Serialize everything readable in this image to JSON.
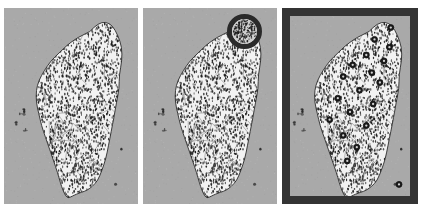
{
  "figure": {
    "background_color": "#ffffff",
    "width": 422,
    "height": 213,
    "panel_count": 3
  },
  "colors": {
    "sea_background": "#a9a9a9",
    "land_fill": "#f2f2f2",
    "stipple_dot": "#1c1c1c",
    "boundary_line": "#5a5a5a",
    "coastline": "#2b2b2b",
    "frame_dark": "#343434",
    "marker_fill": "#1a1a1a",
    "marker_ring": "#111111",
    "highlight_ring": "#2a2a2a",
    "highlight_inner": "#cfcfcf"
  },
  "panels": [
    {
      "id": "panel-a",
      "label": "a",
      "region_name": "Taiwan",
      "has_frame": false,
      "has_highlight_circle": false,
      "marker_count": 0,
      "description": "Base map of Taiwan island with stippled land fill and township boundary lines, surrounded by gray sea, with Penghu archipelago to the west."
    },
    {
      "id": "panel-b",
      "label": "b",
      "region_name": "Taiwan",
      "has_frame": false,
      "has_highlight_circle": true,
      "marker_count": 0,
      "highlight_circle": {
        "center_x_pct": 76,
        "center_y_pct": 12,
        "radius_pct": 13,
        "target_area": "northern Taiwan",
        "ring_color": "#2a2a2a",
        "inner_color": "#cfcfcf"
      },
      "description": "Same base map of Taiwan with a dark circular highlight overlaid on the northern tip of the island."
    },
    {
      "id": "panel-c",
      "label": "c",
      "region_name": "Taiwan",
      "has_frame": true,
      "has_highlight_circle": false,
      "marker_count": 19,
      "frame": {
        "color": "#343434",
        "thickness_px": 8
      },
      "description": "Same base map of Taiwan enclosed in a thick dark rectangular frame, with scattered dark circular point markers distributed across the island and offshore."
    }
  ],
  "map_data": {
    "island_name": "Taiwan",
    "coastline_points": [
      [
        64,
        12
      ],
      [
        70,
        8
      ],
      [
        76,
        7
      ],
      [
        81,
        9
      ],
      [
        85,
        14
      ],
      [
        88,
        20
      ],
      [
        88,
        27
      ],
      [
        86,
        34
      ],
      [
        86,
        41
      ],
      [
        84,
        48
      ],
      [
        82,
        56
      ],
      [
        80,
        63
      ],
      [
        78,
        70
      ],
      [
        76,
        77
      ],
      [
        73,
        83
      ],
      [
        70,
        88
      ],
      [
        66,
        91
      ],
      [
        62,
        93
      ],
      [
        58,
        94
      ],
      [
        54,
        95
      ],
      [
        51,
        96
      ],
      [
        48,
        97
      ],
      [
        46,
        96
      ],
      [
        44,
        93
      ],
      [
        42,
        89
      ],
      [
        40,
        84
      ],
      [
        37,
        78
      ],
      [
        34,
        72
      ],
      [
        31,
        66
      ],
      [
        28,
        60
      ],
      [
        26,
        54
      ],
      [
        24,
        48
      ],
      [
        24,
        42
      ],
      [
        26,
        37
      ],
      [
        30,
        32
      ],
      [
        35,
        27
      ],
      [
        41,
        23
      ],
      [
        47,
        19
      ],
      [
        53,
        16
      ],
      [
        58,
        14
      ]
    ],
    "offshore_islands": [
      {
        "name": "Penghu (Pescadores)",
        "x_pct": 13,
        "y_pct": 53,
        "size": "cluster"
      },
      {
        "name": "Penghu outlier",
        "x_pct": 9,
        "y_pct": 59,
        "size": "small"
      },
      {
        "name": "Penghu outlier",
        "x_pct": 16,
        "y_pct": 62,
        "size": "small"
      },
      {
        "name": "Xiaoliuqiu",
        "x_pct": 27,
        "y_pct": 47,
        "size": "tiny"
      },
      {
        "name": "Green Island",
        "x_pct": 88,
        "y_pct": 72,
        "size": "tiny"
      },
      {
        "name": "Orchid Island",
        "x_pct": 83,
        "y_pct": 90,
        "size": "tiny"
      }
    ]
  },
  "chart_data": {
    "type": "map",
    "panel_labels": [
      "a",
      "b",
      "c"
    ],
    "markers": [
      {
        "x_pct": 80,
        "y_pct": 10
      },
      {
        "x_pct": 68,
        "y_pct": 16
      },
      {
        "x_pct": 79,
        "y_pct": 20
      },
      {
        "x_pct": 62,
        "y_pct": 24
      },
      {
        "x_pct": 75,
        "y_pct": 27
      },
      {
        "x_pct": 52,
        "y_pct": 29
      },
      {
        "x_pct": 66,
        "y_pct": 33
      },
      {
        "x_pct": 45,
        "y_pct": 35
      },
      {
        "x_pct": 72,
        "y_pct": 38
      },
      {
        "x_pct": 57,
        "y_pct": 42
      },
      {
        "x_pct": 41,
        "y_pct": 46
      },
      {
        "x_pct": 67,
        "y_pct": 49
      },
      {
        "x_pct": 50,
        "y_pct": 53
      },
      {
        "x_pct": 35,
        "y_pct": 57
      },
      {
        "x_pct": 62,
        "y_pct": 60
      },
      {
        "x_pct": 45,
        "y_pct": 65
      },
      {
        "x_pct": 55,
        "y_pct": 71
      },
      {
        "x_pct": 48,
        "y_pct": 78
      },
      {
        "x_pct": 86,
        "y_pct": 90
      }
    ],
    "marker_style": {
      "shape": "circle",
      "fill": "#1a1a1a",
      "radius_px": 3
    },
    "legend": [],
    "annotations": []
  }
}
